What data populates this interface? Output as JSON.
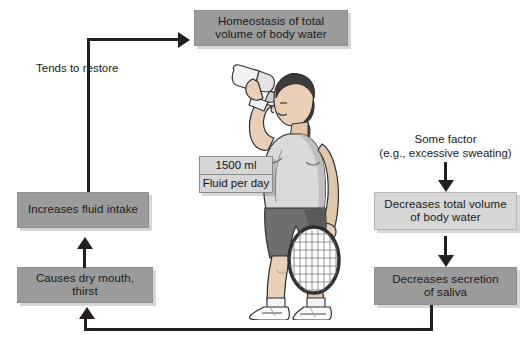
{
  "diagram": {
    "colors": {
      "box_medium": "#9b9b9b",
      "box_light": "#d6d6d6",
      "connector": "#231f20",
      "background": "#ffffff",
      "skin": "#e8cfb6",
      "hair": "#3c3a3c",
      "shirt": "#d9d9d9",
      "shorts": "#6e6e6e"
    },
    "nodes": {
      "homeostasis": {
        "line1": "Homeostasis of total",
        "line2": "volume of body water"
      },
      "some_factor": {
        "line1": "Some factor",
        "line2": "(e.g., excessive sweating)"
      },
      "decreases_volume": {
        "line1": "Decreases total volume",
        "line2": "of body water"
      },
      "decreases_saliva": {
        "line1": "Decreases secretion",
        "line2": "of saliva"
      },
      "dry_mouth": {
        "line1": "Causes dry mouth, thirst"
      },
      "increases_intake": {
        "line1": "Increases fluid intake"
      },
      "tends_to_restore": {
        "line1": "Tends to restore"
      }
    },
    "callout": {
      "amount": "1500 ml",
      "period": "Fluid per day"
    },
    "illustration": {
      "name": "tennis-player-drinking-water",
      "alt": "Woman in tennis clothes drinking from a water bottle and holding a tennis racket"
    }
  }
}
